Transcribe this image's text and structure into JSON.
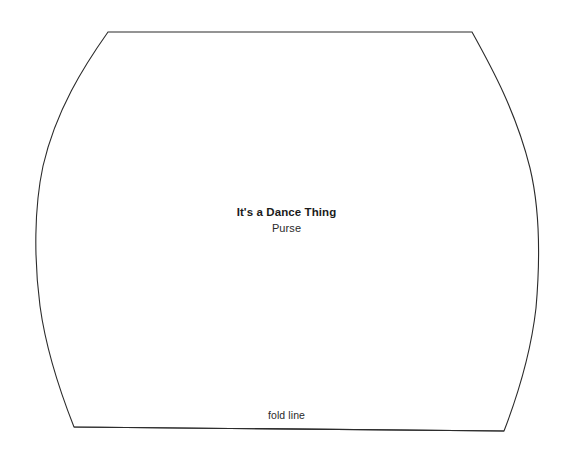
{
  "document": {
    "kind": "sewing-pattern-template",
    "background_color": "#ffffff",
    "line_color": "#2b2b2b",
    "width": 573,
    "height": 455
  },
  "center_label": {
    "title": "It's a Dance Thing",
    "subtitle": "Purse"
  },
  "fold_line": {
    "label": "fold line"
  },
  "shape": {
    "name": "purse-pattern-outline",
    "outline_path": "M 108 32 L 472 32 C 492 68 516 112 530 168 C 540 210 540 262 536 308 C 531 352 519 392 504 431 L 74 427 C 59 389 46 350 40 306 C 34 260 34 208 43 166 C 56 110 84 66 108 32 Z",
    "fold_line_path": "M 74 427 L 504 431"
  }
}
